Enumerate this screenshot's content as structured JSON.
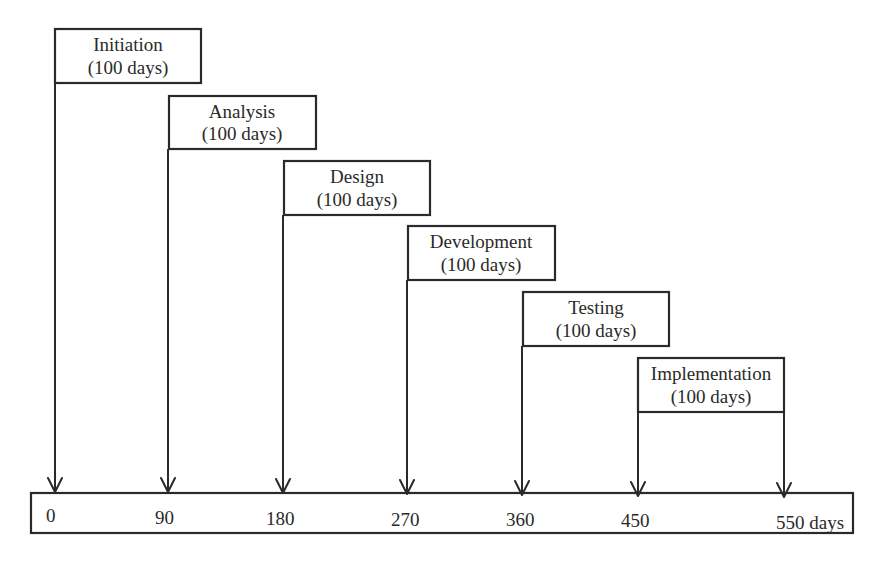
{
  "diagram": {
    "title": "",
    "phases": [
      {
        "name": "Initiation",
        "duration": "(100 days)",
        "start_day": 0
      },
      {
        "name": "Analysis",
        "duration": "(100 days)",
        "start_day": 90
      },
      {
        "name": "Design",
        "duration": "(100 days)",
        "start_day": 180
      },
      {
        "name": "Development",
        "duration": "(100 days)",
        "start_day": 270
      },
      {
        "name": "Testing",
        "duration": "(100 days)",
        "start_day": 360
      },
      {
        "name": "Implementation",
        "duration": "(100 days)",
        "start_day": 450,
        "end_day": 550
      }
    ],
    "timeline": {
      "ticks": [
        "0",
        "90",
        "180",
        "270",
        "360",
        "450",
        "550 days"
      ]
    },
    "colors": {
      "stroke": "#2a2a2a",
      "background": "#ffffff"
    }
  }
}
